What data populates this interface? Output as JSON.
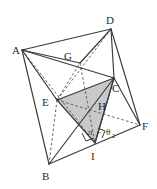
{
  "figure": {
    "colors": {
      "stroke": "#3a3a3a",
      "dashed": "#555555",
      "shade_fill": "#c9c9c9",
      "background": "#ffffff",
      "label": "#2b2b2b"
    },
    "vertices": [
      {
        "name": "A",
        "label": "A",
        "x": 22,
        "y": 50,
        "lx": 12,
        "ly": 52
      },
      {
        "name": "D",
        "label": "D",
        "x": 111,
        "y": 29,
        "lx": 108,
        "ly": 24
      },
      {
        "name": "G",
        "label": "G",
        "x": 80,
        "y": 63,
        "lx": 66,
        "ly": 59
      },
      {
        "name": "C",
        "label": "C",
        "x": 114,
        "y": 78,
        "lx": 114,
        "ly": 91
      },
      {
        "name": "E",
        "label": "E",
        "x": 57,
        "y": 100,
        "lx": 45,
        "ly": 105
      },
      {
        "name": "H",
        "label": "H",
        "x": 101,
        "y": 110,
        "lx": 101,
        "ly": 107
      },
      {
        "name": "F",
        "label": "F",
        "x": 140,
        "y": 125,
        "lx": 143,
        "ly": 128
      },
      {
        "name": "I",
        "label": "I",
        "x": 95,
        "y": 143,
        "lx": 92,
        "ly": 157
      },
      {
        "name": "B",
        "label": "B",
        "x": 49,
        "y": 164,
        "lx": 44,
        "ly": 178
      }
    ],
    "angle_annotation": {
      "pi_symbol": "π",
      "minus_symbol": "−",
      "theta_symbol": "θ",
      "theta_subscript": "2",
      "full_text": "π − θ₂",
      "x": 103,
      "y": 132
    },
    "right_angle_marks": [
      {
        "name": "right-angle-at-I-left"
      },
      {
        "name": "right-angle-at-I-right"
      }
    ],
    "shaded_face": {
      "name": "triangle-E-C-I",
      "points": "57,100 114,78 95,143"
    },
    "solid_edges": [
      "A-D",
      "A-C",
      "A-B",
      "D-C",
      "D-F",
      "C-F",
      "B-F",
      "A-E",
      "E-C",
      "E-I",
      "C-I",
      "B-C",
      "E-B",
      "B-D"
    ],
    "dashed_edges": [
      "A-E-hidden",
      "D-E",
      "E-F",
      "E-G-B",
      "A-I"
    ]
  }
}
